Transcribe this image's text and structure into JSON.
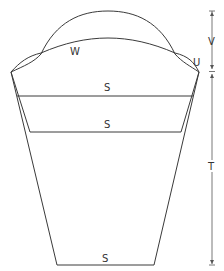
{
  "diagram": {
    "type": "sleeve pattern",
    "labels": {
      "cap_curve": "W",
      "seam_point": "U",
      "width_line_top": "S",
      "width_line_middle": "S",
      "width_line_bottom": "S",
      "cap_height": "V",
      "sleeve_length": "T"
    },
    "colors": {
      "line": "#3a3a3a",
      "dimension": "#555555",
      "background": "#ffffff"
    }
  }
}
